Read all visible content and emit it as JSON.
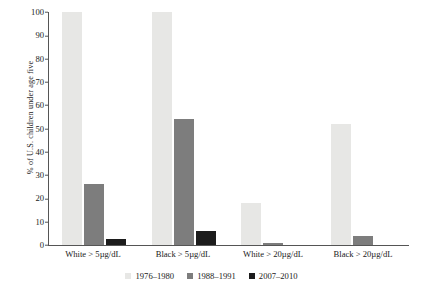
{
  "chart_data": {
    "type": "bar",
    "title": "",
    "xlabel": "",
    "ylabel": "% of U.S. children under age five",
    "ylim": [
      0,
      100
    ],
    "yticks": [
      0,
      10,
      20,
      30,
      40,
      50,
      60,
      70,
      80,
      90,
      100
    ],
    "grid": false,
    "legend_position": "bottom-center",
    "categories": [
      "White > 5µg/dL",
      "Black > 5µg/dL",
      "White > 20µg/dL",
      "Black > 20µg/dL"
    ],
    "series": [
      {
        "name": "1976–1980",
        "color": "#e7e7e5",
        "values": [
          100,
          100,
          18,
          52
        ]
      },
      {
        "name": "1988–1991",
        "color": "#7d7d7d",
        "values": [
          26,
          54,
          1,
          4
        ]
      },
      {
        "name": "2007–2010",
        "color": "#1c1c1c",
        "values": [
          2.5,
          6,
          0,
          0
        ]
      }
    ]
  }
}
